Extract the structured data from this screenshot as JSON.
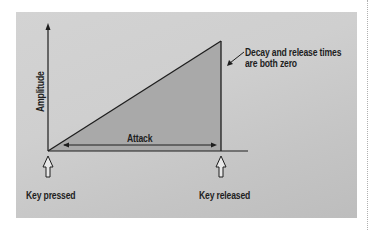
{
  "diagram": {
    "type": "envelope",
    "y_axis_label": "Amplitude",
    "segment_label": "Attack",
    "markers": [
      {
        "label": "Key pressed"
      },
      {
        "label": "Key released"
      }
    ],
    "annotation": {
      "line1": "Decay and release times",
      "line2": "are both zero"
    },
    "colors": {
      "panel_bg": "#cfcfcf",
      "envelope_fill": "#a9a9a9",
      "lines": "#1e1e1e",
      "marker_arrow_fill": "#e8e8e8"
    }
  }
}
